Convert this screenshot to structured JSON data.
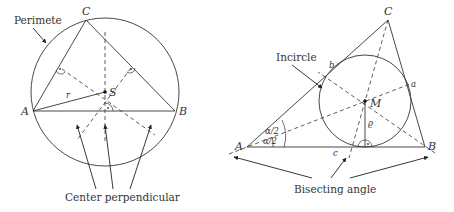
{
  "left_figure": {
    "title": "Circumcircle construction",
    "callout_label": "Perimete",
    "vertex_labels": {
      "A": "A",
      "B": "B",
      "C": "C"
    },
    "center_label": "S",
    "radius_label": "r",
    "bottom_caption": "Center perpendicular"
  },
  "right_figure": {
    "title": "Incircle construction",
    "callout_label": "Incircle",
    "vertex_labels": {
      "A": "A",
      "B": "B",
      "C": "C"
    },
    "side_labels": {
      "a": "a",
      "b": "b",
      "c": "c"
    },
    "center_label": "M",
    "radius_label": "ϱ",
    "angle_labels": [
      "α/2",
      "α/2"
    ],
    "bottom_caption": "Bisecting angle"
  },
  "colors": {
    "stroke": "#333333",
    "text": "#333333",
    "background": "#ffffff"
  }
}
